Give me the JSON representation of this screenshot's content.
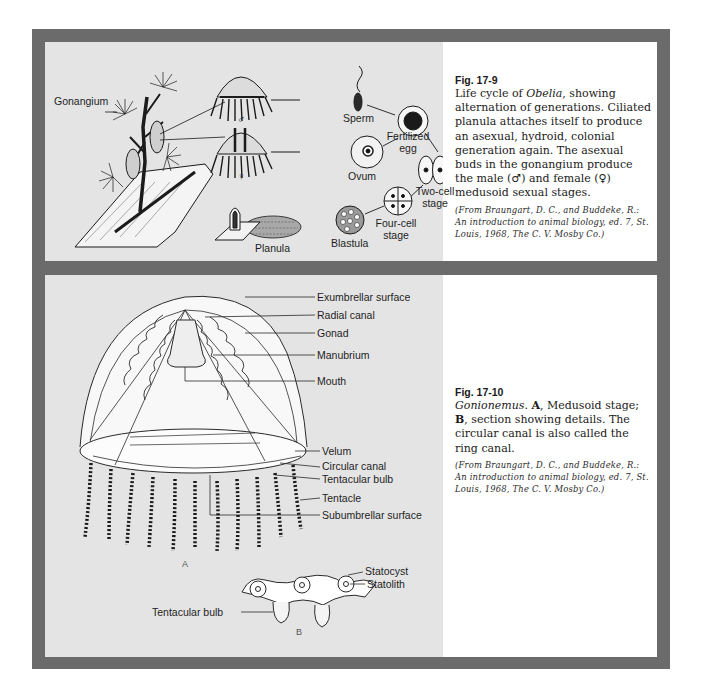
{
  "figures": [
    {
      "number": "Fig. 17-9",
      "caption_parts": {
        "p1": "Life cycle of ",
        "genus": "Obelia",
        "p2": ", showing alternation of generations. Ciliated planula attaches itself to produce an asexual, hydroid, colonial generation again. The asexual buds in the gonangium produce the male (♂) and female (♀) medusoid sexual stages."
      },
      "credit": "(From Braungart, D. C., and Buddeke, R.: An introduction to animal biology, ed. 7, St. Louis, 1968, The C. V. Mosby Co.)",
      "labels": {
        "gonangium": "Gonangium",
        "male_symbol": "♂",
        "female_symbol": "♀",
        "sperm": "Sperm",
        "ovum": "Ovum",
        "fertilized_line1": "Fertilized",
        "fertilized_line2": "egg",
        "two_cell_line1": "Two-cell",
        "two_cell_line2": "stage",
        "four_cell_line1": "Four-cell",
        "four_cell_line2": "stage",
        "blastula": "Blastula",
        "planula": "Planula"
      }
    },
    {
      "number": "Fig. 17-10",
      "caption_parts": {
        "genus": "Gonionemus",
        "p1": ". ",
        "a": "A",
        "p2": ", Medusoid stage; ",
        "b": "B",
        "p3": ", section showing details. The circular canal is also called the ring canal."
      },
      "credit": "(From Braungart, D. C., and Buddeke, R.: An introduction to animal biology, ed. 7, St. Louis, 1968, The C. V. Mosby Co.)",
      "labels": {
        "exumbrellar": "Exumbrellar surface",
        "radial_canal": "Radial canal",
        "gonad": "Gonad",
        "manubrium": "Manubrium",
        "mouth": "Mouth",
        "velum": "Velum",
        "circular_canal": "Circular canal",
        "tentacular_bulb": "Tentacular bulb",
        "tentacle": "Tentacle",
        "subumbrellar": "Subumbrellar surface",
        "part_a": "A",
        "statocyst": "Statocyst",
        "statolith": "Statolith",
        "tentacular_bulb_b": "Tentacular bulb",
        "part_b": "B"
      }
    }
  ],
  "colors": {
    "frame": "#6b6b6b",
    "art_background": "#e4e4e4",
    "caption_background": "#ffffff"
  }
}
